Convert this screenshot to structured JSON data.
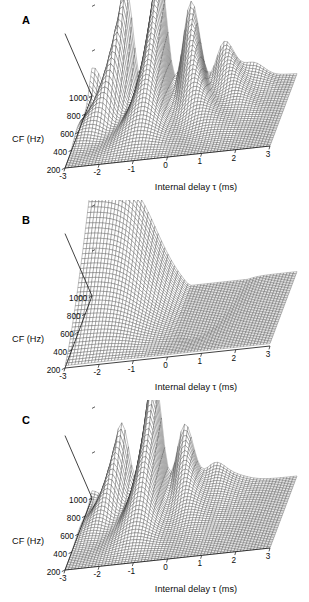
{
  "figure": {
    "background": "#ffffff",
    "ink": "#111111",
    "panels": [
      "A",
      "B",
      "C"
    ]
  },
  "panel_a": {
    "letter": "A"
  },
  "panel_b": {
    "letter": "B"
  },
  "panel_c": {
    "letter": "C"
  },
  "axes": {
    "x_title": "Internal delay τ (ms)",
    "y_title": "CF (Hz)",
    "x_ticks": [
      "-3",
      "-2",
      "-1",
      "0",
      "1",
      "2",
      "3"
    ],
    "y_ticks": [
      "200",
      "400",
      "600",
      "800",
      "1000"
    ]
  },
  "chart_data": [
    {
      "id": "A",
      "type": "surface",
      "title": "",
      "panel_label": "A",
      "xlabel": "Internal delay τ (ms)",
      "ylabel": "CF (Hz)",
      "zlabel": "",
      "xlim": [
        -3,
        3
      ],
      "ylim": [
        200,
        1000
      ],
      "zlim": [
        0,
        1
      ],
      "x_tick_values": [
        -3,
        -2,
        -1,
        0,
        1,
        2,
        3
      ],
      "y_tick_values": [
        200,
        400,
        600,
        800,
        1000
      ],
      "z_tick_count": 3,
      "grid": false,
      "legend": "none",
      "mesh": {
        "nx": 61,
        "ny": 41,
        "style": "wireframe",
        "color": "#2a2a2a"
      },
      "view": {
        "azimuth": -37,
        "elevation": 28
      },
      "description": "Cross-correlation surface with multiple sharp ridges; dominant peak near tau = -1 ms spanning high CF, with secondary side peaks near -2 and 0 ms decaying toward low CF.",
      "peaks": [
        {
          "tau": -2.05,
          "cf": 950,
          "amplitude": 0.55
        },
        {
          "tau": -1.05,
          "cf": 950,
          "amplitude": 1.0
        },
        {
          "tau": -0.55,
          "cf": 900,
          "amplitude": 0.62
        },
        {
          "tau": 0.35,
          "cf": 820,
          "amplitude": 0.45
        },
        {
          "tau": 1.3,
          "cf": 720,
          "amplitude": 0.3
        }
      ]
    },
    {
      "id": "B",
      "type": "surface",
      "title": "",
      "panel_label": "B",
      "xlabel": "Internal delay τ (ms)",
      "ylabel": "CF (Hz)",
      "zlabel": "",
      "xlim": [
        -3,
        3
      ],
      "ylim": [
        200,
        1000
      ],
      "zlim": [
        0,
        1
      ],
      "x_tick_values": [
        -3,
        -2,
        -1,
        0,
        1,
        2,
        3
      ],
      "y_tick_values": [
        200,
        400,
        600,
        800,
        1000
      ],
      "z_tick_count": 3,
      "grid": false,
      "legend": "none",
      "mesh": {
        "nx": 61,
        "ny": 41,
        "style": "wireframe",
        "color": "#2a2a2a"
      },
      "view": {
        "azimuth": -37,
        "elevation": 28
      },
      "description": "Smooth single monotonic ridge rising steeply toward negative tau with a broad trough near tau = 0.4 ms; no side lobes.",
      "peaks": [
        {
          "tau": -1.1,
          "cf": 1000,
          "amplitude": 1.0
        }
      ]
    },
    {
      "id": "C",
      "type": "surface",
      "title": "",
      "panel_label": "C",
      "xlabel": "Internal delay τ (ms)",
      "ylabel": "CF (Hz)",
      "zlabel": "",
      "xlim": [
        -3,
        3
      ],
      "ylim": [
        200,
        1000
      ],
      "zlim": [
        0,
        1
      ],
      "x_tick_values": [
        -3,
        -2,
        -1,
        0,
        1,
        2,
        3
      ],
      "y_tick_values": [
        200,
        400,
        600,
        800,
        1000
      ],
      "z_tick_count": 3,
      "grid": false,
      "legend": "none",
      "mesh": {
        "nx": 61,
        "ny": 41,
        "style": "wireframe",
        "color": "#2a2a2a"
      },
      "view": {
        "azimuth": -37,
        "elevation": 28
      },
      "description": "Narrow twin peak near tau = -1.2 ms with reduced side lobes compared with panel A; ridge decays smoothly toward low CF and positive tau.",
      "peaks": [
        {
          "tau": -1.25,
          "cf": 960,
          "amplitude": 1.0
        },
        {
          "tau": -0.85,
          "cf": 930,
          "amplitude": 0.72
        },
        {
          "tau": -2.2,
          "cf": 780,
          "amplitude": 0.28
        },
        {
          "tau": 0.6,
          "cf": 760,
          "amplitude": 0.3
        }
      ]
    }
  ]
}
